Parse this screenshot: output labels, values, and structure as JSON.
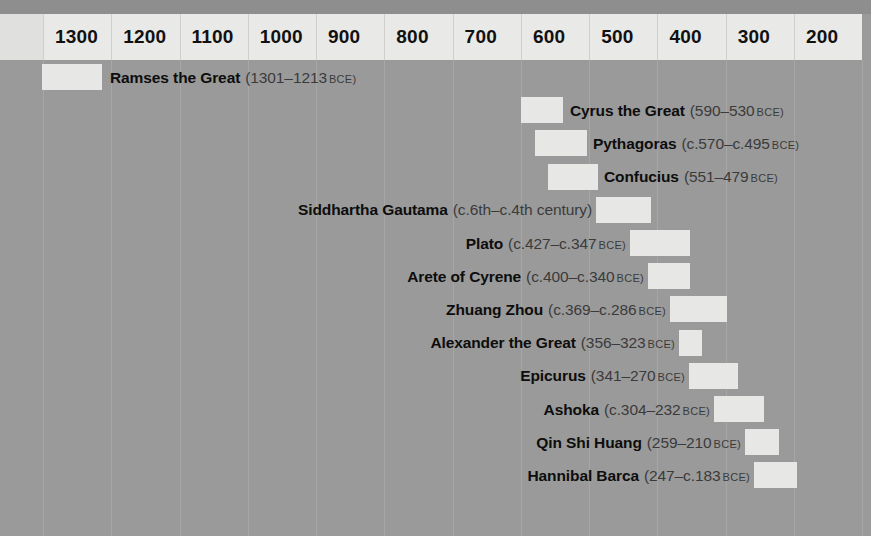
{
  "chart_data": {
    "type": "bar",
    "orientation": "horizontal",
    "title": "",
    "xlabel": "",
    "ylabel": "",
    "axis": {
      "unit": "BCE",
      "direction": "descending",
      "ticks": [
        "1300",
        "1200",
        "1100",
        "1000",
        "900",
        "800",
        "700",
        "600",
        "500",
        "400",
        "300",
        "200"
      ],
      "tick_years": [
        1300,
        1200,
        1100,
        1000,
        900,
        800,
        700,
        600,
        500,
        400,
        300,
        200
      ],
      "xlim": [
        1340,
        170
      ],
      "grid": true
    },
    "legend": {
      "visible": false
    },
    "categories": [
      "Ramses the Great",
      "Cyrus the Great",
      "Pythagoras",
      "Confucius",
      "Siddhartha Gautama",
      "Plato",
      "Arete of Cyrene",
      "Zhuang Zhou",
      "Alexander the Great",
      "Epicurus",
      "Ashoka",
      "Qin Shi Huang",
      "Hannibal Barca"
    ],
    "series": [
      {
        "name": "Lifespan (BCE)",
        "values": [
          88,
          60,
          75,
          72,
          80,
          80,
          60,
          83,
          33,
          71,
          72,
          49,
          64
        ]
      }
    ],
    "bars": [
      {
        "name": "Ramses the Great",
        "dates": "(1301–1213",
        "suffix": "BCE)",
        "start": 1301,
        "end": 1213,
        "bar_x": 42,
        "bar_w": 60,
        "label_side": "right",
        "label_x": 110
      },
      {
        "name": "Cyrus the Great",
        "dates": "(590–530",
        "suffix": "BCE)",
        "start": 590,
        "end": 530,
        "bar_x": 521,
        "bar_w": 42,
        "label_side": "right",
        "label_x": 570
      },
      {
        "name": "Pythagoras",
        "dates": "(c.570–c.495",
        "suffix": "BCE)",
        "start": 570,
        "end": 495,
        "bar_x": 535,
        "bar_w": 52,
        "label_side": "right",
        "label_x": 593
      },
      {
        "name": "Confucius",
        "dates": "(551–479",
        "suffix": "BCE)",
        "start": 551,
        "end": 479,
        "bar_x": 548,
        "bar_w": 50,
        "label_side": "right",
        "label_x": 604
      },
      {
        "name": "Siddhartha Gautama",
        "dates": "(c.6th–c.4th century)",
        "suffix": "",
        "start": 600,
        "end": 400,
        "bar_x": 596,
        "bar_w": 55,
        "label_side": "left",
        "label_x": 592
      },
      {
        "name": "Plato",
        "dates": "(c.427–c.347",
        "suffix": "BCE)",
        "start": 427,
        "end": 347,
        "bar_x": 630,
        "bar_w": 60,
        "label_side": "left",
        "label_x": 626
      },
      {
        "name": "Arete of Cyrene",
        "dates": "(c.400–c.340",
        "suffix": "BCE)",
        "start": 400,
        "end": 340,
        "bar_x": 648,
        "bar_w": 42,
        "label_side": "left",
        "label_x": 644
      },
      {
        "name": "Zhuang Zhou",
        "dates": "(c.369–c.286",
        "suffix": "BCE)",
        "start": 369,
        "end": 286,
        "bar_x": 670,
        "bar_w": 57,
        "label_side": "left",
        "label_x": 666
      },
      {
        "name": "Alexander the Great",
        "dates": "(356–323",
        "suffix": "BCE)",
        "start": 356,
        "end": 323,
        "bar_x": 679,
        "bar_w": 23,
        "label_side": "left",
        "label_x": 675
      },
      {
        "name": "Epicurus",
        "dates": "(341–270",
        "suffix": "BCE)",
        "start": 341,
        "end": 270,
        "bar_x": 689,
        "bar_w": 49,
        "label_side": "left",
        "label_x": 685
      },
      {
        "name": "Ashoka",
        "dates": "(c.304–232",
        "suffix": "BCE)",
        "start": 304,
        "end": 232,
        "bar_x": 714,
        "bar_w": 50,
        "label_side": "left",
        "label_x": 710
      },
      {
        "name": "Qin Shi Huang",
        "dates": "(259–210",
        "suffix": "BCE)",
        "start": 259,
        "end": 210,
        "bar_x": 745,
        "bar_w": 34,
        "label_side": "left",
        "label_x": 741
      },
      {
        "name": "Hannibal Barca",
        "dates": "(247–c.183",
        "suffix": "BCE)",
        "start": 247,
        "end": 183,
        "bar_x": 754,
        "bar_w": 43,
        "label_side": "left",
        "label_x": 750
      }
    ]
  },
  "colors": {
    "background": "#9a9a9a",
    "top_strip": "#8e8e8e",
    "header_band": "#e9e9e7",
    "bar_fill": "#e7e7e5",
    "gridline": "#a8a8a8",
    "name_text": "#0d0d0d",
    "date_text": "#3a3a3a"
  }
}
